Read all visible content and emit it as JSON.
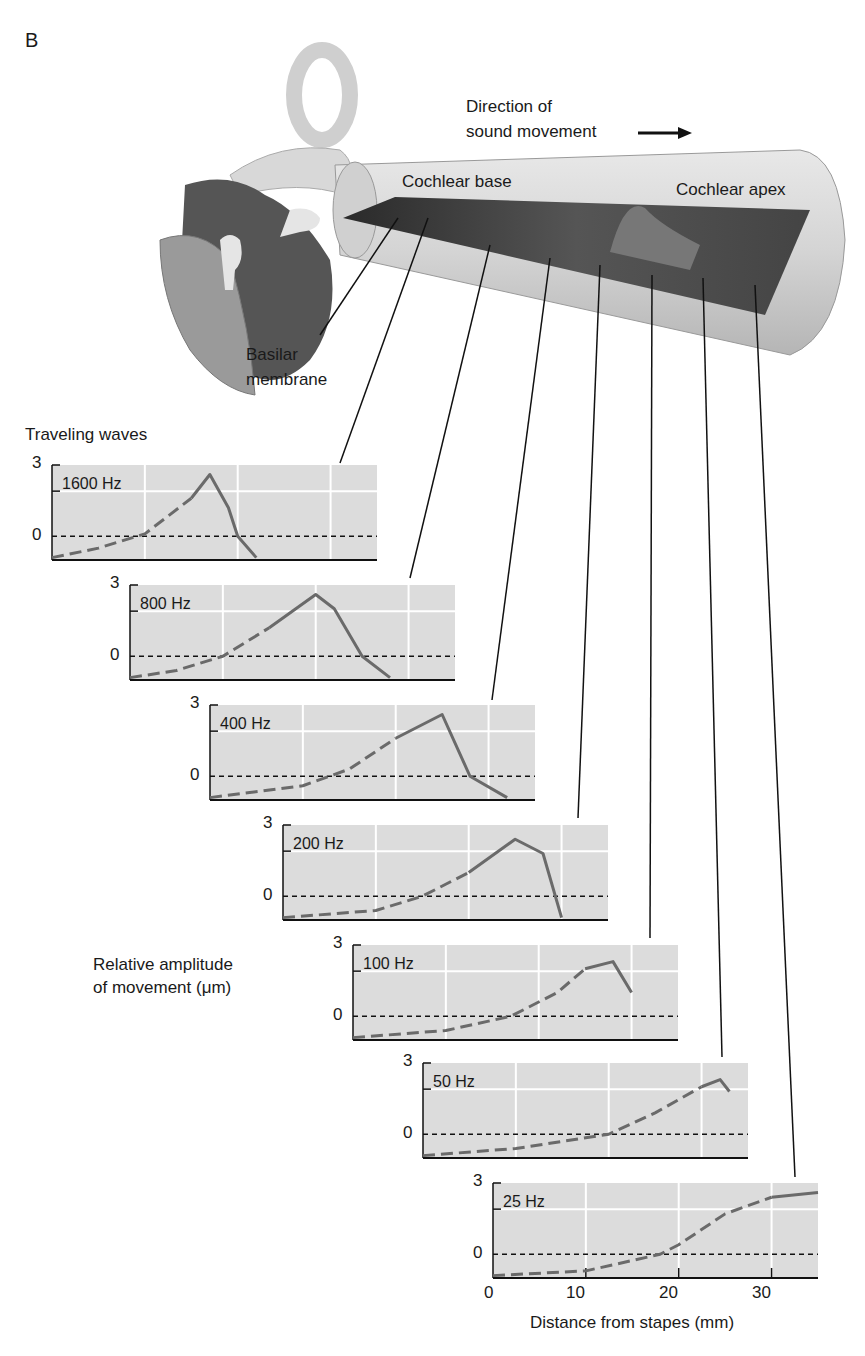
{
  "figure": {
    "panel_letter": "B",
    "labels": {
      "direction_line1": "Direction of",
      "direction_line2": "sound movement",
      "cochlear_base": "Cochlear base",
      "cochlear_apex": "Cochlear apex",
      "basilar_line1": "Basilar",
      "basilar_line2": "membrane",
      "traveling_waves": "Traveling waves",
      "amplitude_line1": "Relative amplitude",
      "amplitude_line2": "of movement (μm)",
      "xlabel": "Distance from stapes (mm)"
    },
    "y_ticks": [
      "3",
      "0"
    ],
    "x_ticks": [
      "0",
      "10",
      "20",
      "30"
    ],
    "panels": [
      {
        "freq": "1600 Hz"
      },
      {
        "freq": "800 Hz"
      },
      {
        "freq": "400 Hz"
      },
      {
        "freq": "200 Hz"
      },
      {
        "freq": "100 Hz"
      },
      {
        "freq": "50 Hz"
      },
      {
        "freq": "25 Hz"
      }
    ]
  },
  "chart_data": {
    "type": "line",
    "title": "Traveling waves",
    "xlabel": "Distance from stapes (mm)",
    "ylabel": "Relative amplitude of movement (μm)",
    "xlim": [
      0,
      35
    ],
    "ylim": [
      -1,
      3
    ],
    "grid": true,
    "series": [
      {
        "name": "1600 Hz",
        "x": [
          0,
          5,
          10,
          15,
          17,
          19,
          20,
          22
        ],
        "y": [
          -0.9,
          -0.5,
          0.1,
          1.6,
          2.6,
          1.2,
          0.0,
          -0.9
        ]
      },
      {
        "name": "800 Hz",
        "x": [
          0,
          5,
          10,
          15,
          20,
          22,
          25,
          28
        ],
        "y": [
          -0.9,
          -0.6,
          0.0,
          1.2,
          2.6,
          2.0,
          0.0,
          -0.9
        ]
      },
      {
        "name": "400 Hz",
        "x": [
          0,
          10,
          15,
          20,
          25,
          28,
          32
        ],
        "y": [
          -0.9,
          -0.4,
          0.3,
          1.6,
          2.6,
          0.0,
          -0.9
        ]
      },
      {
        "name": "200 Hz",
        "x": [
          0,
          10,
          15,
          20,
          25,
          28,
          30
        ],
        "y": [
          -0.9,
          -0.6,
          0.0,
          1.0,
          2.4,
          1.8,
          -0.9
        ]
      },
      {
        "name": "100 Hz",
        "x": [
          0,
          10,
          17,
          22,
          25,
          28,
          30
        ],
        "y": [
          -0.9,
          -0.6,
          0.0,
          1.0,
          2.0,
          2.3,
          1.0
        ]
      },
      {
        "name": "50 Hz",
        "x": [
          0,
          10,
          20,
          25,
          30,
          32,
          33
        ],
        "y": [
          -0.9,
          -0.6,
          0.0,
          0.9,
          2.0,
          2.3,
          1.8
        ]
      },
      {
        "name": "25 Hz",
        "x": [
          0,
          10,
          18,
          20,
          25,
          30,
          35
        ],
        "y": [
          -0.9,
          -0.7,
          0.0,
          0.4,
          1.7,
          2.4,
          2.6
        ]
      }
    ]
  }
}
